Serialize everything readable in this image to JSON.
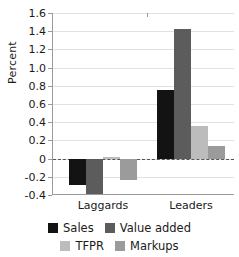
{
  "chart_data": {
    "type": "bar",
    "title": "",
    "subtitle": "",
    "xlabel": "",
    "ylabel": "Percent",
    "categories": [
      "Laggards",
      "Leaders"
    ],
    "series": [
      {
        "name": "Sales",
        "color": "#131313",
        "values": [
          -0.29,
          0.75
        ]
      },
      {
        "name": "Value added",
        "color": "#5c5c5c",
        "values": [
          -0.39,
          1.42
        ]
      },
      {
        "name": "TFPR",
        "color": "#bcbcbc",
        "values": [
          0.02,
          0.36
        ]
      },
      {
        "name": "Markups",
        "color": "#9b9b9b",
        "values": [
          -0.23,
          0.14
        ]
      }
    ],
    "ylim": [
      -0.4,
      1.6
    ],
    "yticks": [
      1.6,
      1.4,
      1.2,
      1.0,
      0.8,
      0.6,
      0.4,
      0.2,
      0,
      -0.2,
      -0.4
    ],
    "ytick_labels": [
      "1.6",
      "1.4",
      "1.2",
      "1.0",
      "0.8",
      "0.6",
      "0.4",
      "0.2",
      "0",
      "-0.2",
      "-0.4"
    ],
    "grid": true,
    "zero_line": true,
    "zero_line_style": "dashed",
    "legend_position": "bottom",
    "legend_columns": 2
  },
  "legend": {
    "entries": [
      {
        "label": "Sales"
      },
      {
        "label": "Value added"
      },
      {
        "label": "TFPR"
      },
      {
        "label": "Markups"
      }
    ]
  },
  "colors": {
    "sales": "#131313",
    "value_added": "#5c5c5c",
    "tfpr": "#bcbcbc",
    "markups": "#9b9b9b",
    "grid": "#e2e2e2",
    "axis": "#9a9a9a",
    "zero_line": "#555555",
    "text": "#1a1a1a",
    "background": "#ffffff"
  }
}
